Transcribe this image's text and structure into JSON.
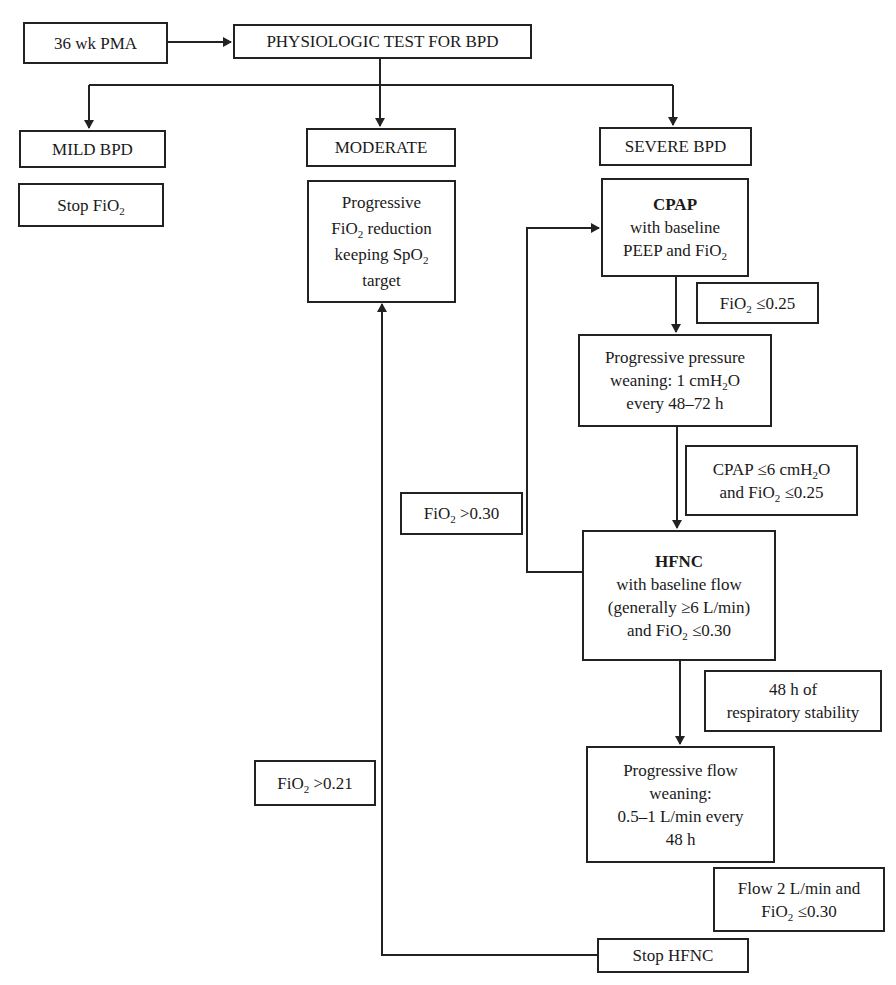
{
  "diagram": {
    "type": "flowchart",
    "colors": {
      "line": "#222222",
      "box_fill": "#ffffff",
      "text": "#1a1a1a"
    },
    "nodes": {
      "start": {
        "lines": [
          "36 wk PMA"
        ]
      },
      "test": {
        "lines": [
          "PHYSIOLOGIC TEST FOR BPD"
        ]
      },
      "mild": {
        "lines": [
          "MILD BPD"
        ]
      },
      "moderate": {
        "lines": [
          "MODERATE"
        ]
      },
      "severe": {
        "lines": [
          "SEVERE BPD"
        ]
      },
      "stop_fio2": {
        "pre": "Stop FiO",
        "sub": "2",
        "post": ""
      },
      "fio2_reduction": {
        "l1": "Progressive",
        "l2_pre": "FiO",
        "l2_sub": "2",
        "l2_post": " reduction",
        "l3_pre": "keeping SpO",
        "l3_sub": "2",
        "l3_post": "",
        "l4": "target"
      },
      "cpap": {
        "title": "CPAP",
        "l2": "with baseline",
        "l3_pre": "PEEP and FiO",
        "l3_sub": "2",
        "l3_post": ""
      },
      "pressure_weaning": {
        "l1": "Progressive pressure",
        "l2_pre": "weaning: 1 cmH",
        "l2_sub": "2",
        "l2_post": "O",
        "l3": "every 48–72 h"
      },
      "hfnc": {
        "title": "HFNC",
        "l2": "with baseline flow",
        "l3": "(generally ≥6 L/min)",
        "l4_pre": "and FiO",
        "l4_sub": "2",
        "l4_post": " ≤0.30"
      },
      "flow_weaning": {
        "l1": "Progressive flow",
        "l2": "weaning:",
        "l3": "0.5–1 L/min every",
        "l4": "48 h"
      },
      "stop_hfnc": {
        "lines": [
          "Stop HFNC"
        ]
      }
    },
    "conditions": {
      "fio2_le_025": {
        "pre": "FiO",
        "sub": "2",
        "post": " ≤0.25"
      },
      "cpap_le_6": {
        "l1_pre": "CPAP ≤6 cmH",
        "l1_sub": "2",
        "l1_post": "O",
        "l2_pre": "and FiO",
        "l2_sub": "2",
        "l2_post": " ≤0.25"
      },
      "fio2_gt_030": {
        "pre": "FiO",
        "sub": "2",
        "post": " >0.30"
      },
      "stability_48h": {
        "l1": "48 h of",
        "l2": "respiratory stability"
      },
      "fio2_gt_021": {
        "pre": "FiO",
        "sub": "2",
        "post": " >0.21"
      },
      "flow_2": {
        "l1": "Flow 2 L/min and",
        "l2_pre": "FiO",
        "l2_sub": "2",
        "l2_post": " ≤0.30"
      }
    },
    "edges": [
      {
        "from": "36 wk PMA",
        "to": "PHYSIOLOGIC TEST FOR BPD"
      },
      {
        "from": "PHYSIOLOGIC TEST FOR BPD",
        "to": "MILD BPD"
      },
      {
        "from": "PHYSIOLOGIC TEST FOR BPD",
        "to": "MODERATE"
      },
      {
        "from": "PHYSIOLOGIC TEST FOR BPD",
        "to": "SEVERE BPD"
      },
      {
        "from": "CPAP",
        "to": "Progressive pressure weaning",
        "condition": "FiO2 ≤0.25"
      },
      {
        "from": "Progressive pressure weaning",
        "to": "HFNC",
        "condition": "CPAP ≤6 cmH2O and FiO2 ≤0.25"
      },
      {
        "from": "HFNC",
        "to": "CPAP",
        "condition": "FiO2 >0.30"
      },
      {
        "from": "HFNC",
        "to": "Progressive flow weaning",
        "condition": "48 h of respiratory stability"
      },
      {
        "from": "Stop HFNC",
        "to": "Progressive FiO2 reduction",
        "condition": "FiO2 >0.21"
      }
    ]
  }
}
